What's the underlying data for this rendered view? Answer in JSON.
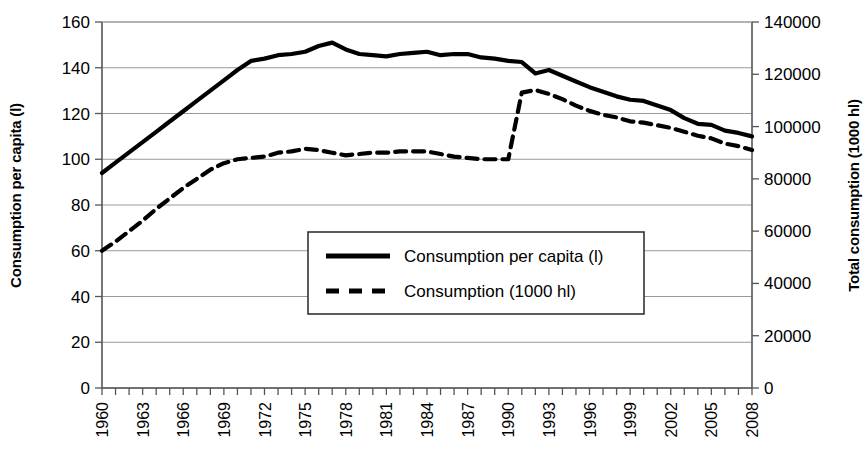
{
  "chart_data": {
    "type": "line",
    "title": "",
    "xlabel": "",
    "x": [
      1960,
      1961,
      1962,
      1963,
      1964,
      1965,
      1966,
      1967,
      1968,
      1969,
      1970,
      1971,
      1972,
      1973,
      1974,
      1975,
      1976,
      1977,
      1978,
      1979,
      1980,
      1981,
      1982,
      1983,
      1984,
      1985,
      1986,
      1987,
      1988,
      1989,
      1990,
      1991,
      1992,
      1993,
      1994,
      1995,
      1996,
      1997,
      1998,
      1999,
      2000,
      2001,
      2002,
      2003,
      2004,
      2005,
      2006,
      2007,
      2008
    ],
    "xtick_labels": [
      "1960",
      "1963",
      "1966",
      "1969",
      "1972",
      "1975",
      "1978",
      "1981",
      "1984",
      "1987",
      "1990",
      "1993",
      "1996",
      "1999",
      "2002",
      "2005",
      "2008"
    ],
    "xtick_label_step": 3,
    "grid": true,
    "legend_position": "center",
    "axes": [
      {
        "id": "left",
        "label": "Consumption per capita (l)",
        "ylim": [
          0,
          160
        ],
        "ticks": [
          0,
          20,
          40,
          60,
          80,
          100,
          120,
          140,
          160
        ],
        "tick_labels": [
          "0",
          "20",
          "40",
          "60",
          "80",
          "100",
          "120",
          "140",
          "160"
        ]
      },
      {
        "id": "right",
        "label": "Total consumption (1000 hl)",
        "ylim": [
          0,
          140000
        ],
        "ticks": [
          0,
          20000,
          40000,
          60000,
          80000,
          100000,
          120000,
          140000
        ],
        "tick_labels": [
          "0",
          "20000",
          "40000",
          "60000",
          "80000",
          "100000",
          "120000",
          "140000"
        ]
      }
    ],
    "series": [
      {
        "name": "Consumption per capita (l)",
        "axis": "left",
        "style": "solid",
        "unit": "l",
        "values": [
          94.0,
          98.5,
          103.0,
          107.5,
          112.0,
          116.5,
          121.0,
          125.5,
          130.0,
          134.5,
          139.0,
          143.0,
          144.0,
          145.5,
          146.0,
          147.0,
          149.5,
          151.0,
          148.0,
          146.0,
          145.5,
          145.0,
          146.0,
          146.5,
          147.0,
          145.5,
          146.0,
          146.0,
          144.5,
          144.0,
          143.0,
          142.5,
          137.5,
          139.0,
          136.5,
          134.0,
          131.5,
          129.5,
          127.5,
          126.0,
          125.5,
          123.5,
          121.5,
          118.0,
          115.5,
          115.0,
          112.5,
          111.5,
          110.0
        ]
      },
      {
        "name": "Consumption (1000 hl)",
        "axis": "right",
        "style": "dashed",
        "unit": "1000 hl",
        "values": [
          52500,
          56000,
          60000,
          64000,
          68500,
          72500,
          76500,
          80000,
          83500,
          86000,
          87500,
          88000,
          88500,
          90000,
          90500,
          91500,
          91000,
          90000,
          89000,
          89500,
          90000,
          90000,
          90500,
          90500,
          90500,
          89500,
          88500,
          88000,
          87500,
          87500,
          87500,
          113000,
          114000,
          112500,
          110500,
          108000,
          106000,
          104500,
          103500,
          102000,
          101500,
          100500,
          99500,
          98000,
          96500,
          95500,
          93500,
          92500,
          91000
        ]
      }
    ]
  },
  "legend": {
    "items": [
      {
        "label": "Consumption per capita (l)",
        "style": "solid"
      },
      {
        "label": "Consumption (1000 hl)",
        "style": "dashed"
      }
    ]
  }
}
